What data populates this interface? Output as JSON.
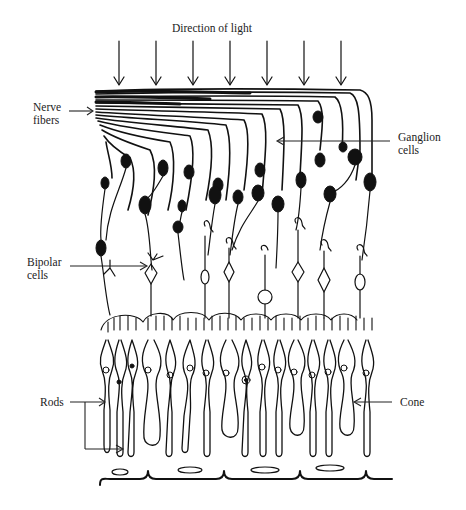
{
  "figure": {
    "labels": {
      "direction_of_light": "Direction of light",
      "nerve_fibers": "Nerve\nfibers",
      "ganglion_cells": "Ganglion\ncells",
      "bipolar_cells": "Bipolar\ncells",
      "rods": "Rods",
      "cone": "Cone"
    },
    "light_arrows": {
      "count": 7,
      "x_positions": [
        119,
        156,
        193,
        230,
        267,
        304,
        341
      ],
      "y_start": 40,
      "y_end": 86
    },
    "colors": {
      "ink": "#111111",
      "background": "#ffffff",
      "label_text": "#222222"
    }
  }
}
